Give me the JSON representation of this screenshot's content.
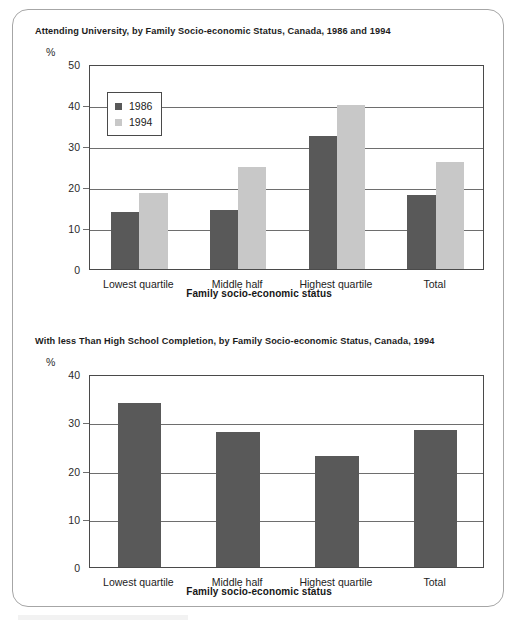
{
  "page": {
    "background_color": "#ffffff",
    "frame_color": "#a6a6a6"
  },
  "colors": {
    "bar_1986": "#595959",
    "bar_1994": "#c8c8c8",
    "axis": "#4a4a4a",
    "grid": "#6e6e6e",
    "text": "#222222"
  },
  "chart_data": [
    {
      "id": "attending-university",
      "type": "bar",
      "title": "Attending University, by Family Socio-economic Status, Canada, 1986 and 1994",
      "xlabel": "Family socio-economic status",
      "ylabel": "%",
      "ylim": [
        0,
        50
      ],
      "yticks": [
        0,
        10,
        20,
        30,
        40,
        50
      ],
      "ytick_labels": [
        "0",
        "10",
        "20",
        "30",
        "40",
        "50"
      ],
      "grid": true,
      "legend_position": "upper-left",
      "categories": [
        "Lowest quartile",
        "Middle half",
        "Highest quartile",
        "Total"
      ],
      "series": [
        {
          "name": "1986",
          "color": "#595959",
          "values": [
            14,
            14.3,
            32.5,
            18
          ]
        },
        {
          "name": "1994",
          "color": "#c8c8c8",
          "values": [
            18.5,
            25,
            40,
            26
          ]
        }
      ]
    },
    {
      "id": "less-than-high-school",
      "type": "bar",
      "title": "With less Than High School Completion, by Family Socio-economic Status, Canada, 1994",
      "xlabel": "Family socio-economic status",
      "ylabel": "%",
      "ylim": [
        0,
        40
      ],
      "yticks": [
        0,
        10,
        20,
        30,
        40
      ],
      "ytick_labels": [
        "0",
        "10",
        "20",
        "30",
        "40"
      ],
      "grid": true,
      "legend_position": "none",
      "categories": [
        "Lowest quartile",
        "Middle half",
        "Highest quartile",
        "Total"
      ],
      "series": [
        {
          "name": "1994",
          "color": "#595959",
          "values": [
            34,
            28,
            23,
            28.3
          ]
        }
      ]
    }
  ]
}
